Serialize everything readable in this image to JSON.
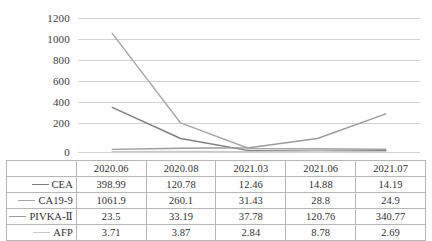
{
  "chart_data": {
    "type": "line",
    "title": "",
    "xlabel": "",
    "ylabel": "",
    "categories": [
      "2020.06",
      "2020.08",
      "2021.03",
      "2021.06",
      "2021.07"
    ],
    "ylim": [
      0,
      1200
    ],
    "yticks": [
      0,
      200,
      400,
      600,
      800,
      1000,
      1200
    ],
    "ytick_labels": [
      "0",
      "200",
      "400",
      "600",
      "800",
      "1000",
      "1200"
    ],
    "grid": true,
    "legend_position": "data-table-left",
    "series": [
      {
        "name": "CEA",
        "color": "#7f7f7f",
        "values": [
          398.99,
          120.78,
          12.46,
          14.88,
          14.19
        ],
        "value_labels": [
          "398.99",
          "120.78",
          "12.46",
          "14.88",
          "14.19"
        ]
      },
      {
        "name": "CA19-9",
        "color": "#a6a6a6",
        "values": [
          1061.9,
          260.1,
          31.43,
          28.8,
          24.9
        ],
        "value_labels": [
          "1061.9",
          "260.1",
          "31.43",
          "28.8",
          "24.9"
        ]
      },
      {
        "name": "PIVKA-Ⅱ",
        "color": "#9b9b9b",
        "values": [
          23.5,
          33.19,
          37.78,
          120.76,
          340.77
        ],
        "value_labels": [
          "23.5",
          "33.19",
          "37.78",
          "120.76",
          "340.77"
        ]
      },
      {
        "name": "AFP",
        "color": "#c9c9c9",
        "values": [
          3.71,
          3.87,
          2.84,
          8.78,
          2.69
        ],
        "value_labels": [
          "3.71",
          "3.87",
          "2.84",
          "8.78",
          "2.69"
        ]
      }
    ]
  },
  "table": {
    "header_blank": "",
    "header_row": [
      "2020.06",
      "2020.08",
      "2021.03",
      "2021.06",
      "2021.07"
    ],
    "rows": [
      {
        "label": "CEA",
        "cells": [
          "398.99",
          "120.78",
          "12.46",
          "14.88",
          "14.19"
        ]
      },
      {
        "label": "CA19-9",
        "cells": [
          "1061.9",
          "260.1",
          "31.43",
          "28.8",
          "24.9"
        ]
      },
      {
        "label": "PIVKA-Ⅱ",
        "cells": [
          "23.5",
          "33.19",
          "37.78",
          "120.76",
          "340.77"
        ]
      },
      {
        "label": "AFP",
        "cells": [
          "3.71",
          "3.87",
          "2.84",
          "8.78",
          "2.69"
        ]
      }
    ]
  },
  "colors": {
    "gridline": "#d2d2d2",
    "border": "#b7b7b7",
    "text": "#303030"
  }
}
